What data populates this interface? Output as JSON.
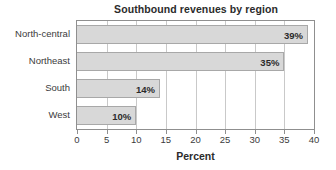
{
  "chart_data": {
    "type": "bar",
    "orientation": "horizontal",
    "title": "Southbound revenues by region",
    "xlabel": "Percent",
    "ylabel": "",
    "categories": [
      "North-central",
      "Northeast",
      "South",
      "West"
    ],
    "values": [
      39,
      35,
      14,
      10
    ],
    "data_labels": [
      "39%",
      "35%",
      "14%",
      "10%"
    ],
    "xlim": [
      0,
      40
    ],
    "xticks": [
      0,
      5,
      10,
      15,
      20,
      25,
      30,
      35,
      40
    ],
    "xtick_labels": [
      "0",
      "5",
      "10",
      "15",
      "20",
      "25",
      "30",
      "35",
      "40"
    ],
    "grid": "vertical",
    "legend": null,
    "colors": {
      "bar_fill": "#d8d8d8",
      "bar_border": "#a8a8a8",
      "gridline": "#c9c9c9",
      "axis": "#8f8f8f",
      "text": "#3b3b3b",
      "title_text": "#2b2b2b",
      "background": "#ffffff"
    }
  }
}
